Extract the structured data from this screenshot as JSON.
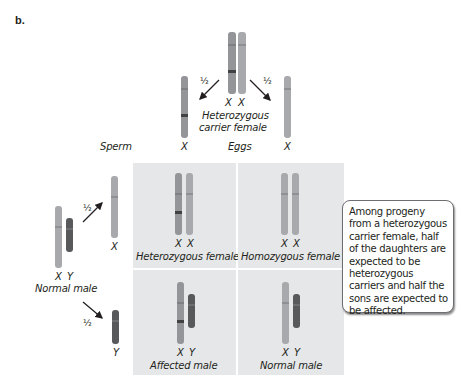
{
  "figure": {
    "panel_label": "b.",
    "parent_female": {
      "chromosome_labels": [
        "X",
        "X"
      ],
      "caption_line1": "Heterozygous",
      "caption_line2": "carrier female"
    },
    "parent_male": {
      "chromosome_labels": [
        "X",
        "Y"
      ],
      "caption": "Normal male"
    },
    "gametes": {
      "sperm_label": "Sperm",
      "eggs_label": "Eggs",
      "egg_left_label": "X",
      "egg_right_label": "X",
      "sperm_top_label": "X",
      "sperm_bottom_label": "Y",
      "probability": "½"
    },
    "punnett": [
      {
        "labels": [
          "X",
          "X"
        ],
        "caption": "Heterozygous female"
      },
      {
        "labels": [
          "X",
          "X"
        ],
        "caption": "Homozygous female"
      },
      {
        "labels": [
          "X",
          "Y"
        ],
        "caption": "Affected male"
      },
      {
        "labels": [
          "X",
          "Y"
        ],
        "caption": "Normal male"
      }
    ],
    "callout_text": "Among progeny from a heterozygous carrier female, half of the daughters are expected to be heterozygous carriers and half the sons are expected to be affected.",
    "colors": {
      "x_chromosome": "#939598",
      "y_chromosome": "#58595b",
      "mutant_band": "#414042",
      "cell_bg": "#e6e7e8",
      "text": "#231f20"
    }
  }
}
